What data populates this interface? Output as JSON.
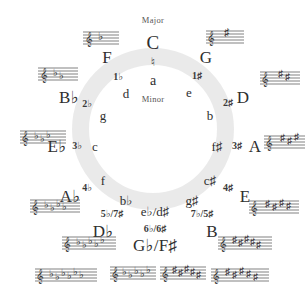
{
  "center": {
    "major_caption": "Major",
    "minor_caption": "Minor",
    "top_major": "C",
    "natural_sign": "♮",
    "top_minor": "a"
  },
  "keys": [
    {
      "id": "c",
      "major": "C",
      "minor": "a",
      "accidentals": "♮",
      "angle": 0
    },
    {
      "id": "g",
      "major": "G",
      "minor": "e",
      "accidentals": "1♯",
      "angle": 30
    },
    {
      "id": "d",
      "major": "D",
      "minor": "b",
      "accidentals": "2♯",
      "angle": 60
    },
    {
      "id": "a",
      "major": "A",
      "minor": "f♯",
      "accidentals": "3♯",
      "angle": 90
    },
    {
      "id": "e",
      "major": "E",
      "minor": "c♯",
      "accidentals": "4♯",
      "angle": 120
    },
    {
      "id": "b",
      "major": "B",
      "minor": "g♯",
      "accidentals": "7♭/5♯",
      "angle": 150
    },
    {
      "id": "gb-fs",
      "major": "G♭/F♯",
      "minor": "e♭/d♯",
      "accidentals": "6♭/6♯",
      "angle": 180
    },
    {
      "id": "db",
      "major": "D♭",
      "minor": "b♭",
      "accidentals": "5♭/7♯",
      "angle": 210
    },
    {
      "id": "ab",
      "major": "A♭",
      "minor": "f",
      "accidentals": "4♭",
      "angle": 240
    },
    {
      "id": "eb",
      "major": "E♭",
      "minor": "c",
      "accidentals": "3♭",
      "angle": 270
    },
    {
      "id": "bb",
      "major": "B♭",
      "minor": "g",
      "accidentals": "2♭",
      "angle": 300
    },
    {
      "id": "f",
      "major": "F",
      "minor": "d",
      "accidentals": "1♭",
      "angle": 330
    }
  ],
  "staves": [
    {
      "key": "C",
      "accidental_count": 0,
      "accidental_type": "natural"
    },
    {
      "key": "G",
      "accidental_count": 1,
      "accidental_type": "sharp"
    },
    {
      "key": "D",
      "accidental_count": 2,
      "accidental_type": "sharp"
    },
    {
      "key": "A",
      "accidental_count": 3,
      "accidental_type": "sharp"
    },
    {
      "key": "E",
      "accidental_count": 4,
      "accidental_type": "sharp"
    },
    {
      "key": "B",
      "accidental_count": 5,
      "accidental_type": "sharp"
    },
    {
      "key": "F♯",
      "accidental_count": 6,
      "accidental_type": "sharp"
    },
    {
      "key": "G♭",
      "accidental_count": 6,
      "accidental_type": "flat"
    },
    {
      "key": "D♭",
      "accidental_count": 5,
      "accidental_type": "flat"
    },
    {
      "key": "A♭",
      "accidental_count": 4,
      "accidental_type": "flat"
    },
    {
      "key": "E♭",
      "accidental_count": 3,
      "accidental_type": "flat"
    },
    {
      "key": "B♭",
      "accidental_count": 2,
      "accidental_type": "flat"
    },
    {
      "key": "F",
      "accidental_count": 1,
      "accidental_type": "flat"
    }
  ],
  "colors": {
    "ring": "#e9e9e9",
    "text": "#2e2e2e",
    "caption": "#555555",
    "background": "#ffffff"
  }
}
